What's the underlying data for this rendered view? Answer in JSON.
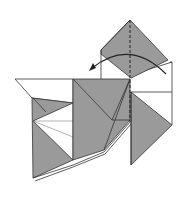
{
  "diagram": {
    "colors": {
      "paper_colored": "#9a9a9a",
      "paper_white": "#ffffff",
      "line": "#333333"
    },
    "annotations": {
      "valley_fold_line": "vertical dashed valley fold",
      "fold_arrow": "curved arrow pointing left — fold the right flap over to the left"
    }
  }
}
